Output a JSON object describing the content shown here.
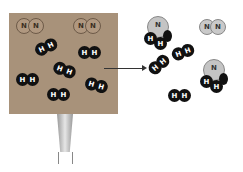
{
  "diagram": {
    "title": "",
    "reactants": {
      "container": "heated-box",
      "n2_molecules": [
        {
          "atoms": [
            "N",
            "N"
          ]
        },
        {
          "atoms": [
            "N",
            "N"
          ]
        }
      ],
      "h2_molecules": [
        {
          "atoms": [
            "H",
            "H"
          ]
        },
        {
          "atoms": [
            "H",
            "H"
          ]
        },
        {
          "atoms": [
            "H",
            "H"
          ]
        },
        {
          "atoms": [
            "H",
            "H"
          ]
        },
        {
          "atoms": [
            "H",
            "H"
          ]
        },
        {
          "atoms": [
            "H",
            "H"
          ]
        }
      ]
    },
    "products": {
      "nh3_molecules": [
        {
          "atoms": [
            "N",
            "H",
            "H",
            "H"
          ]
        },
        {
          "atoms": [
            "N",
            "H",
            "H",
            "H"
          ]
        }
      ],
      "n2_molecules": [
        {
          "atoms": [
            "N",
            "N"
          ]
        }
      ],
      "h2_molecules": [
        {
          "atoms": [
            "H",
            "H"
          ]
        },
        {
          "atoms": [
            "H",
            "H"
          ]
        },
        {
          "atoms": [
            "H",
            "H"
          ]
        }
      ]
    },
    "labels": {
      "N": "N",
      "H": "H"
    },
    "colors": {
      "box": "#a8927a",
      "hydrogen": "#111111",
      "nitrogen_reactant": "#b09880",
      "nitrogen_product": "#c9c9c9"
    }
  }
}
